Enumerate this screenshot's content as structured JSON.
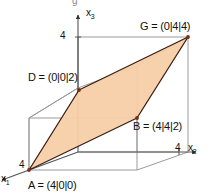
{
  "figure": {
    "title_visible": false,
    "background": "#ffffff",
    "axes": [
      {
        "id": "x3",
        "label": "x",
        "subscript": "3",
        "direction": "up",
        "tick_label": "4"
      },
      {
        "id": "x2",
        "label": "x",
        "subscript": "2",
        "direction": "right",
        "tick_label": "4"
      },
      {
        "id": "x1",
        "label": "x",
        "subscript": "1",
        "direction": "down-left",
        "tick_label": "4"
      }
    ],
    "points": [
      {
        "id": "A",
        "label": "A = (4|0|0)",
        "name": "A",
        "coords": "(4|0|0)"
      },
      {
        "id": "B",
        "label": "B = (4|4|2)",
        "name": "B",
        "coords": "(4|4|2)"
      },
      {
        "id": "G",
        "label": "G = (0|4|4)",
        "name": "G",
        "coords": "(0|4|4)"
      },
      {
        "id": "D",
        "label": "D = (0|0|2)",
        "name": "D",
        "coords": "(0|0|2)"
      }
    ],
    "plane": {
      "vertices": [
        "A",
        "B",
        "G",
        "D"
      ],
      "fill_color": "#f7cfa8",
      "edge_color": "#3a1f14"
    },
    "cube": {
      "edge_color": "#9a9a9a",
      "edge_length_label": "4"
    },
    "top_artifact": "g"
  }
}
